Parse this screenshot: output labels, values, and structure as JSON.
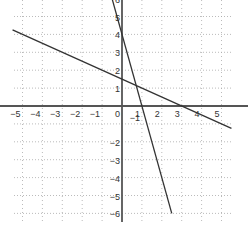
{
  "chart_data": {
    "type": "line",
    "title": "",
    "xlabel": "",
    "ylabel": "",
    "xlim": [
      -5.5,
      5.5
    ],
    "ylim": [
      -6.3,
      6.3
    ],
    "grid": true,
    "x_ticks": [
      -5,
      -4,
      -3,
      -2,
      -1,
      0,
      1,
      2,
      3,
      4,
      5
    ],
    "x_tick_labels": [
      "-5",
      "-4",
      "-3",
      "-2",
      "-1",
      "0",
      "1",
      "2",
      "3",
      "4",
      "5"
    ],
    "y_ticks": [
      -6,
      -5,
      -4,
      -3,
      -2,
      -1,
      1,
      2,
      3,
      4,
      5,
      6
    ],
    "y_tick_labels": [
      "-6",
      "-5",
      "-4",
      "-3",
      "-2",
      "-1",
      "1",
      "2",
      "3",
      "4",
      "5",
      "6"
    ],
    "series": [
      {
        "name": "line-shallow",
        "equation": "y = -0.5x + 1.5",
        "x": [
          -5.5,
          5.5
        ],
        "y": [
          4.25,
          -1.25
        ],
        "color": "#333333"
      },
      {
        "name": "line-steep",
        "equation": "y = -4x + 4",
        "x": [
          -0.5,
          2.5
        ],
        "y": [
          6,
          -6
        ],
        "color": "#333333"
      }
    ]
  },
  "colors": {
    "axis": "#555555",
    "grid": "#aaaaaa",
    "line": "#333333"
  }
}
